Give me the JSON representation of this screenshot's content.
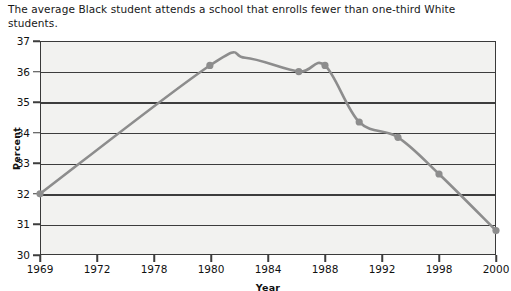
{
  "caption": "The average Black student attends a school that enrolls fewer than one-third White students.",
  "axis": {
    "ylabel": "Percent",
    "xlabel": "Year"
  },
  "colors": {
    "series_line": "#8d8d8d",
    "marker": "#8d8d8d",
    "gridline": "#3d3d3d",
    "plot_background": "#f2f2f0",
    "border": "#3a3a3a",
    "text": "#101010"
  },
  "chart_data": {
    "type": "line",
    "title": "The average Black student attends a school that enrolls fewer than one-third White students.",
    "xlabel": "Year",
    "ylabel": "Percent",
    "ylim": [
      30,
      37
    ],
    "yticks": [
      30,
      31,
      32,
      33,
      34,
      35,
      36,
      37
    ],
    "xticks": [
      "1969",
      "1972",
      "1978",
      "1980",
      "1984",
      "1988",
      "1992",
      "1998",
      "2000"
    ],
    "grid": true,
    "legend": "none",
    "markers": true,
    "smoothing": "spline",
    "x": [
      "1969",
      "1980",
      "1982",
      "1986",
      "1988",
      "1990",
      "1993",
      "1998",
      "2000"
    ],
    "values": [
      32.0,
      36.2,
      36.45,
      36.0,
      36.2,
      34.35,
      33.85,
      32.65,
      30.8
    ],
    "points": [
      {
        "x": "1969",
        "y": 32.0,
        "marker": true,
        "px": 0.0
      },
      {
        "x": "1980",
        "y": 36.2,
        "marker": true,
        "px": 2.98
      },
      {
        "x": "1982",
        "y": 36.45,
        "marker": false,
        "px": 3.6
      },
      {
        "x": "1986",
        "y": 36.0,
        "marker": true,
        "px": 4.54
      },
      {
        "x": "1988",
        "y": 36.2,
        "marker": true,
        "px": 5.0
      },
      {
        "x": "1990",
        "y": 34.35,
        "marker": true,
        "px": 5.6
      },
      {
        "x": "1993",
        "y": 33.85,
        "marker": true,
        "px": 6.28
      },
      {
        "x": "1998",
        "y": 32.65,
        "marker": true,
        "px": 7.0
      },
      {
        "x": "2000",
        "y": 30.8,
        "marker": true,
        "px": 8.0
      }
    ]
  }
}
